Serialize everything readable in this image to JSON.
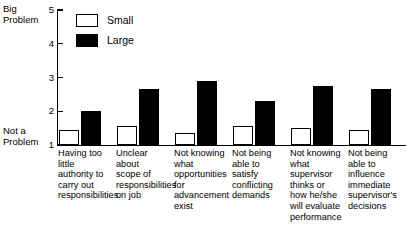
{
  "axis": {
    "y_top_label": "Big\nProblem",
    "y_bottom_label": "Not a\nProblem",
    "ticks": [
      "5",
      "4",
      "3",
      "2",
      "1"
    ]
  },
  "legend": {
    "items": [
      {
        "label": "Small",
        "swatch": "white-box"
      },
      {
        "label": "Large",
        "swatch": "black-box"
      }
    ]
  },
  "chart_data": {
    "type": "bar",
    "title": "",
    "xlabel": "",
    "ylabel": "",
    "ylim": [
      1,
      5
    ],
    "yticks": [
      1,
      2,
      3,
      4,
      5
    ],
    "ytick_labels": [
      "1",
      "2",
      "3",
      "4",
      "5"
    ],
    "y_axis_top_annotation": "Big Problem",
    "y_axis_bottom_annotation": "Not a Problem",
    "grid": false,
    "legend_position": "top-left-inside",
    "categories": [
      "Having too little authority to carry out responsibilities",
      "Unclear about scope of responsibilities on job",
      "Not knowing what opportunities for advancement exist",
      "Not being able to satisfy conflicting demands",
      "Not knowing what supervisor thinks or how he/she will evaluate performance",
      "Not being able to influence immediate supervisor's decisions"
    ],
    "category_labels_wrapped": [
      "Having too\nlittle\nauthority to\ncarry out\nresponsibilities",
      "Unclear about\nscope of\nresponsibilities\non job",
      "Not knowing\nwhat\nopportunities\nfor\nadvancement\nexist",
      "Not being\nable to\nsatisfy\nconflicting\ndemands",
      "Not knowing\nwhat\nsupervisor\nthinks or\nhow he/she\nwill evaluate\nperformance",
      "Not being\nable to\ninfluence\nimmediate\nsupervisor's\ndecisions"
    ],
    "series": [
      {
        "name": "Small",
        "color": "#ffffff",
        "values": [
          1.45,
          1.55,
          1.35,
          1.55,
          1.5,
          1.45
        ]
      },
      {
        "name": "Large",
        "color": "#000000",
        "values": [
          2.0,
          2.65,
          2.9,
          2.3,
          2.75,
          2.65
        ]
      }
    ]
  }
}
